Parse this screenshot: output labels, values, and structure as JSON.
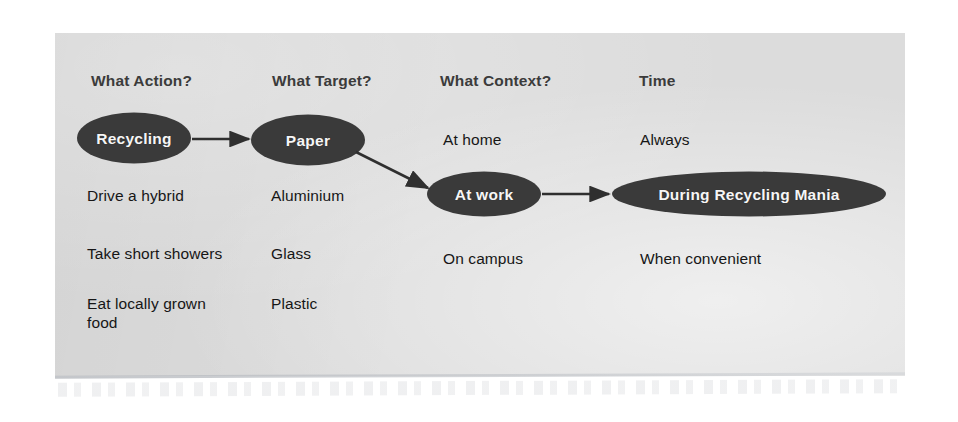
{
  "slide": {
    "panel_color": "#dcdcdc",
    "node_fill": "#3a3a3a",
    "node_text_color": "#f6f6f6",
    "header_text_color": "#3b3b3b",
    "body_text_color": "#161616",
    "arrow_color": "#2f2f2f"
  },
  "columns": [
    {
      "header": "What Action?",
      "items": [
        "Drive a hybrid",
        "Take short showers",
        "Eat locally grown\nfood"
      ]
    },
    {
      "header": "What Target?",
      "items": [
        "Aluminium",
        "Glass",
        "Plastic"
      ]
    },
    {
      "header": "What Context?",
      "items": [
        "At home",
        "On campus"
      ]
    },
    {
      "header": "Time",
      "items": [
        "Always",
        "When convenient"
      ]
    }
  ],
  "headers": {
    "action": "What Action?",
    "target": "What Target?",
    "context": "What Context?",
    "time": "Time"
  },
  "nodes": {
    "action": "Recycling",
    "target": "Paper",
    "context": "At work",
    "time": "During Recycling Mania"
  },
  "items": {
    "action_2": "Drive a hybrid",
    "action_3": "Take short showers",
    "action_4_line1": "Eat locally grown",
    "action_4_line2": "food",
    "target_2": "Aluminium",
    "target_3": "Glass",
    "target_4": "Plastic",
    "context_1": "At home",
    "context_3": "On campus",
    "time_1": "Always",
    "time_3": "When convenient"
  },
  "connections": [
    {
      "from": "Recycling",
      "to": "Paper"
    },
    {
      "from": "Paper",
      "to": "At work"
    },
    {
      "from": "At work",
      "to": "During Recycling Mania"
    }
  ]
}
